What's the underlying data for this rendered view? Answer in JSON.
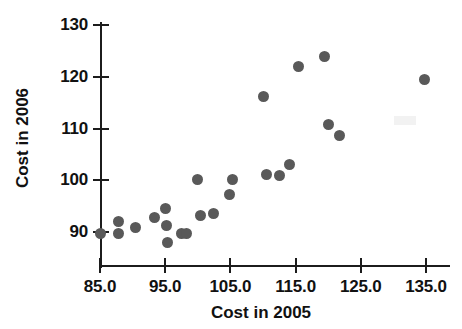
{
  "chart_data": {
    "type": "scatter",
    "title": "",
    "xlabel": "Cost in 2005",
    "ylabel": "Cost in 2006",
    "xlim": [
      85.0,
      135.0
    ],
    "ylim": [
      88.0,
      131.0
    ],
    "grid": false,
    "legend": null,
    "marker_color": "#595959",
    "axis_color": "#1c1c1c",
    "x_ticks": [
      "85.0",
      "95.0",
      "105.0",
      "115.0",
      "125.0",
      "135.0"
    ],
    "x_tick_values": [
      85.0,
      95.0,
      105.0,
      115.0,
      125.0,
      135.0
    ],
    "y_ticks": [
      "90",
      "100",
      "110",
      "120",
      "130"
    ],
    "y_tick_values": [
      90,
      100,
      110,
      120,
      130
    ],
    "points": [
      {
        "x": 85.0,
        "y": 89.8
      },
      {
        "x": 87.9,
        "y": 92.1
      },
      {
        "x": 87.9,
        "y": 89.7
      },
      {
        "x": 90.5,
        "y": 90.9
      },
      {
        "x": 93.4,
        "y": 92.8
      },
      {
        "x": 95.1,
        "y": 94.5
      },
      {
        "x": 95.2,
        "y": 91.3
      },
      {
        "x": 95.3,
        "y": 87.9
      },
      {
        "x": 97.5,
        "y": 89.8
      },
      {
        "x": 98.3,
        "y": 89.8
      },
      {
        "x": 100.0,
        "y": 100.1
      },
      {
        "x": 100.4,
        "y": 93.1
      },
      {
        "x": 102.4,
        "y": 93.5
      },
      {
        "x": 104.9,
        "y": 97.3
      },
      {
        "x": 105.3,
        "y": 100.2
      },
      {
        "x": 110.0,
        "y": 116.2
      },
      {
        "x": 110.5,
        "y": 101.2
      },
      {
        "x": 112.5,
        "y": 100.9
      },
      {
        "x": 114.1,
        "y": 103.0
      },
      {
        "x": 115.4,
        "y": 121.9
      },
      {
        "x": 119.4,
        "y": 124.0
      },
      {
        "x": 120.1,
        "y": 110.7
      },
      {
        "x": 121.7,
        "y": 108.6
      },
      {
        "x": 134.7,
        "y": 119.4
      }
    ]
  }
}
